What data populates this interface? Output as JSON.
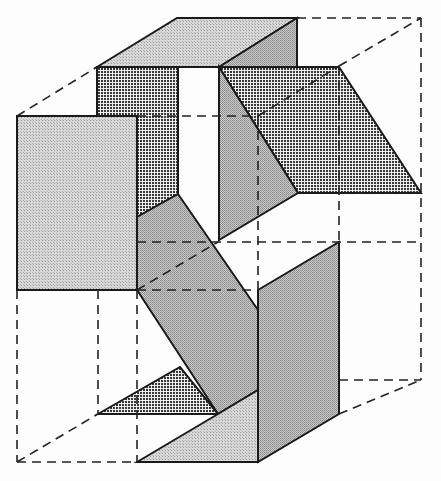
{
  "figure": {
    "colors": {
      "background": "#fdfdfd",
      "light_fill": "#cfcfcf",
      "medium_fill": "#b5b5b5",
      "dark_fill": "#6e6e6e",
      "stroke": "#1a1a1a"
    },
    "panels": [
      {
        "id": "top-face",
        "shade": "light",
        "points": "97,67 177,18 297,18 219,67"
      },
      {
        "id": "top-right-wall",
        "shade": "medium",
        "points": "219,67 297,18 297,67"
      },
      {
        "id": "upper-dark-column",
        "shade": "dark",
        "points": "97,67 178,67 178,194 137,217 137,116 97,116"
      },
      {
        "id": "right-dark-parallelogram",
        "shade": "dark",
        "points": "219,67 339,67 421,193 298,193"
      },
      {
        "id": "right-gray-wall",
        "shade": "medium",
        "points": "219,67 298,193 219,240"
      },
      {
        "id": "left-front-panel",
        "shade": "light",
        "points": "17,116 137,116 137,290 17,290"
      },
      {
        "id": "middle-diagonal-panel",
        "shade": "medium",
        "points": "137,217 178,194 258,310 258,390 218,414 137,290"
      },
      {
        "id": "right-lower-panel",
        "shade": "medium",
        "points": "258,290 339,242 339,414 258,462"
      },
      {
        "id": "bottom-dark-triangle",
        "shade": "dark",
        "points": "98,414 180,367 218,414"
      },
      {
        "id": "bottom-floor-panel",
        "shade": "light",
        "points": "137,462 218,414 258,390 258,462"
      }
    ],
    "dashed_edges": [
      "17,116 97,67",
      "297,18 421,18",
      "421,18 421,380",
      "339,66 421,18",
      "137,116 258,116",
      "258,116 339,66",
      "258,116 258,290",
      "339,193 339,242",
      "137,242 339,242",
      "137,290 258,290",
      "137,290 218,242",
      "17,290 17,462",
      "98,290 98,414",
      "137,290 137,462",
      "17,462 137,462",
      "17,462 98,414",
      "339,380 421,380",
      "339,414 421,380"
    ]
  }
}
